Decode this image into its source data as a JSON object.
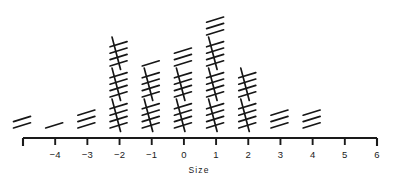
{
  "chart_data": {
    "type": "bar",
    "title": "",
    "subtitle": "",
    "xlabel": "Size",
    "ylabel": "",
    "representation": "tally-marks",
    "grid": false,
    "legend": null,
    "xlim": [
      -5,
      6
    ],
    "axis_ticks": [
      -5,
      -4,
      -3,
      -2,
      -1,
      0,
      1,
      2,
      3,
      4,
      5,
      6
    ],
    "tick_labels": [
      "",
      "−4",
      "−3",
      "−2",
      "−1",
      "0",
      "1",
      "2",
      "3",
      "4",
      "5",
      "6"
    ],
    "categories": [
      -5,
      -4,
      -3,
      -2,
      -1,
      0,
      1,
      2,
      3,
      4,
      5,
      6
    ],
    "values": [
      2,
      1,
      3,
      15,
      11,
      13,
      18,
      10,
      3,
      3,
      0,
      0
    ],
    "tally_rows": [
      [
        2
      ],
      [
        1
      ],
      [
        3
      ],
      [
        5,
        5,
        5
      ],
      [
        5,
        5,
        1
      ],
      [
        5,
        5,
        3
      ],
      [
        5,
        5,
        5,
        3
      ],
      [
        5,
        5
      ],
      [
        3
      ],
      [
        3
      ],
      [],
      []
    ],
    "bundle_size": 5
  },
  "axis": {
    "title": "Size",
    "tick_labels": [
      "",
      "−4",
      "−3",
      "−2",
      "−1",
      "0",
      "1",
      "2",
      "3",
      "4",
      "5",
      "6"
    ]
  },
  "colors": {
    "ink": "#1a1a1a",
    "tally": "#161616",
    "background": "#ffffff"
  }
}
